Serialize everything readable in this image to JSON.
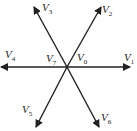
{
  "diagram": {
    "type": "space-vector-diagram",
    "center": {
      "x": 67,
      "y": 67
    },
    "stroke_color": "#222222",
    "vectors": [
      {
        "id": "V1",
        "base": "V",
        "sub": "1",
        "x2": 130,
        "y2": 67,
        "label_x": 124,
        "label_y": 61
      },
      {
        "id": "V2",
        "base": "V",
        "sub": "2",
        "x2": 101,
        "y2": 7,
        "label_x": 102,
        "label_y": 13
      },
      {
        "id": "V3",
        "base": "V",
        "sub": "3",
        "x2": 34,
        "y2": 7,
        "label_x": 42,
        "label_y": 11
      },
      {
        "id": "V4",
        "base": "V",
        "sub": "4",
        "x2": 1,
        "y2": 67,
        "label_x": 5,
        "label_y": 58
      },
      {
        "id": "V5",
        "base": "V",
        "sub": "5",
        "x2": 36,
        "y2": 127,
        "label_x": 22,
        "label_y": 113
      },
      {
        "id": "V6",
        "base": "V",
        "sub": "6",
        "x2": 99,
        "y2": 127,
        "label_x": 101,
        "label_y": 121
      }
    ],
    "zero_vectors": [
      {
        "id": "V7",
        "base": "V",
        "sub": "7",
        "label_x": 46,
        "label_y": 62
      },
      {
        "id": "V0",
        "base": "V",
        "sub": "0",
        "label_x": 77,
        "label_y": 61
      }
    ]
  }
}
